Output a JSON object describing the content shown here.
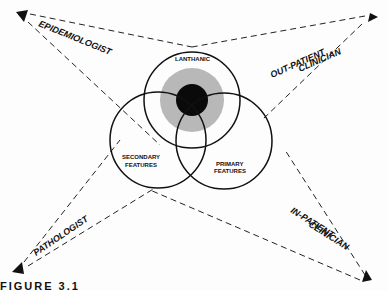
{
  "observers": {
    "top_left": "EPIDEMIOLOGIST",
    "top_right_line1": "OUT-PATIENT",
    "top_right_line2": "CLINICIAN",
    "bottom_left": "PATHOLOGIST",
    "bottom_right_line1": "IN-PATIENT",
    "bottom_right_line2": "CLINICIAN"
  },
  "circles": {
    "top": "LANTHANIC",
    "left_line1": "SECONDARY",
    "left_line2": "FEATURES",
    "right_line1": "PRIMARY",
    "right_line2": "FEATURES"
  },
  "caption": "FIGURE 3.1",
  "colors": {
    "ink": "#111111",
    "shade": "#b8b8b8",
    "core": "#0a0a0a"
  }
}
